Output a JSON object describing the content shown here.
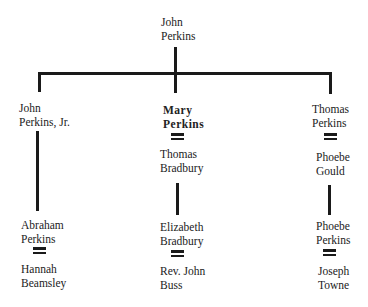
{
  "diagram": {
    "type": "family-tree",
    "root": {
      "line1": "John",
      "line2": "Perkins"
    },
    "children": [
      {
        "person": {
          "line1": "John",
          "line2": "Perkins, Jr."
        },
        "spouse": null,
        "descendant": {
          "line1": "Abraham",
          "line2": "Perkins"
        },
        "descendant_spouse": {
          "line1": "Hannah",
          "line2": "Beamsley"
        }
      },
      {
        "person": {
          "line1": "Mary",
          "line2": "Perkins",
          "emphasis": "bold"
        },
        "spouse": {
          "line1": "Thomas",
          "line2": "Bradbury"
        },
        "descendant": {
          "line1": "Elizabeth",
          "line2": "Bradbury"
        },
        "descendant_spouse": {
          "line1": "Rev. John",
          "line2": "Buss"
        }
      },
      {
        "person": {
          "line1": "Thomas",
          "line2": "Perkins"
        },
        "spouse": {
          "line1": "Phoebe",
          "line2": "Gould"
        },
        "descendant": {
          "line1": "Phoebe",
          "line2": "Perkins"
        },
        "descendant_spouse": {
          "line1": "Joseph",
          "line2": "Towne"
        }
      }
    ],
    "marriage_symbol": "="
  }
}
